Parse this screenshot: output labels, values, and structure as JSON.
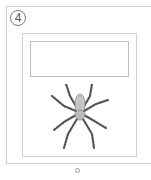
{
  "card": {
    "step_number": "4",
    "text_box_value": "",
    "image": "spider-icon"
  },
  "pagination": {
    "indicator": "page-dot-icon"
  }
}
